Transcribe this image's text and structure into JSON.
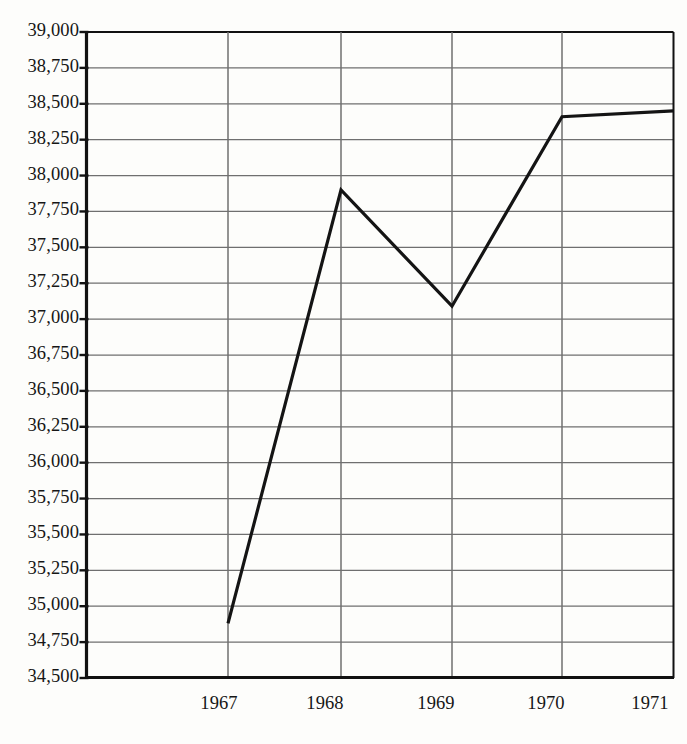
{
  "chart_data": {
    "type": "line",
    "title": "",
    "subtitle": "",
    "xlabel": "",
    "ylabel": "",
    "x": [
      "1967",
      "1968",
      "1969",
      "1970",
      "1971"
    ],
    "categories": [
      "1967",
      "1968",
      "1969",
      "1970",
      "1971"
    ],
    "values": [
      34880,
      37900,
      37090,
      38410,
      38450
    ],
    "series": [
      {
        "name": "",
        "values": [
          34880,
          37900,
          37090,
          38410,
          38450
        ]
      }
    ],
    "ylim": [
      34500,
      39000
    ],
    "ytick_step": 250,
    "ytick_labels": [
      "39,000",
      "38,750",
      "38,500",
      "38,250",
      "38,000",
      "37,750",
      "37,500",
      "37,250",
      "37,000",
      "36,750",
      "36,500",
      "36,250",
      "36,000",
      "35,750",
      "35,500",
      "35,250",
      "35,000",
      "34,750",
      "34,500"
    ],
    "ytick_values": [
      39000,
      38750,
      38500,
      38250,
      38000,
      37750,
      37500,
      37250,
      37000,
      36750,
      36500,
      36250,
      36000,
      35750,
      35500,
      35250,
      35000,
      34750,
      34500
    ],
    "xtick_labels": [
      "1967",
      "1968",
      "1969",
      "1970",
      "1971"
    ],
    "grid": {
      "horizontal": true,
      "vertical": true
    },
    "legend": {
      "visible": false,
      "position": "none",
      "entries": []
    },
    "colors": {
      "background": "#fdfdfb",
      "grid": "#6f6f6f",
      "axis": "#111111",
      "line": "#141414",
      "text": "#161616"
    },
    "line_width_px": 3.2,
    "annotations": []
  }
}
